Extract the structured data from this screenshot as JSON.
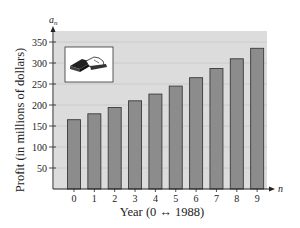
{
  "chart_data": {
    "type": "bar",
    "title": "",
    "xlabel": "Year (0 ↔ 1988)",
    "ylabel": "Profit (in millions of dollars)",
    "x_axis_variable": "n",
    "y_axis_variable": "a",
    "y_axis_variable_subscript": "n",
    "categories": [
      "0",
      "1",
      "2",
      "3",
      "4",
      "5",
      "6",
      "7",
      "8",
      "9"
    ],
    "values": [
      165,
      179,
      194,
      210,
      226,
      245,
      265,
      287,
      310,
      335
    ],
    "yticks": [
      50,
      100,
      150,
      200,
      250,
      300,
      350
    ],
    "ylim": [
      0,
      375
    ],
    "grid": true,
    "legend": "none",
    "inset_icon": "wallet-money-icon",
    "colors": {
      "plot_background": "#dcdcdc",
      "gridline": "#c6c6c6",
      "bar_fill": "#8c8c8c",
      "bar_stroke": "#3a3a3a",
      "axis": "#222222"
    }
  }
}
